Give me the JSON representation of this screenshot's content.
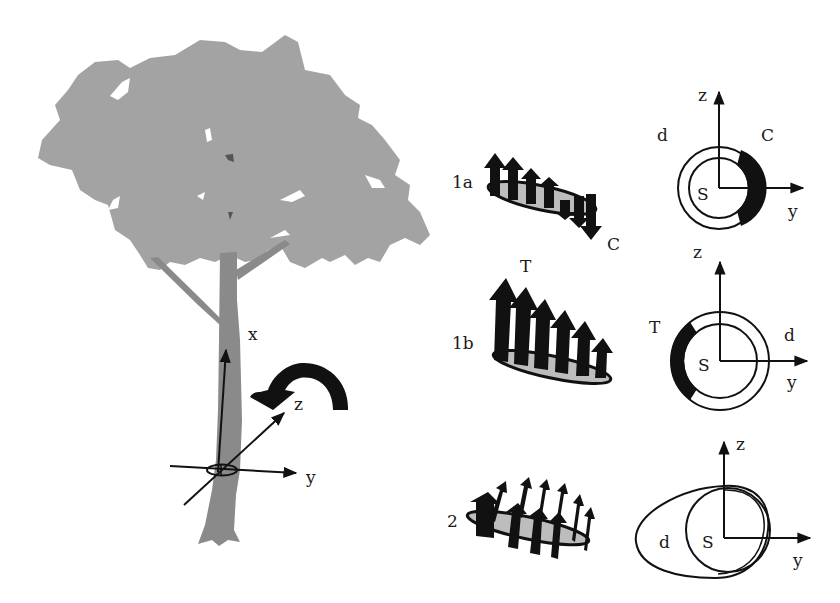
{
  "colors": {
    "crown": "#a3a3a3",
    "trunk": "#8a8a8a",
    "ink": "#111111",
    "disk_fill": "#bdbdbd",
    "background": "#ffffff"
  },
  "tree": {
    "axis_labels": {
      "x": "x",
      "y": "y",
      "z": "z"
    },
    "rotation_arrow": "curved-arrow-about-z"
  },
  "cases": [
    {
      "id": "1a",
      "label": "1a",
      "stress_label": "C",
      "cross_section": {
        "axis_z": "z",
        "axis_y": "y",
        "center": "S",
        "ring": "d",
        "stress_label": "C",
        "highlight_side": "right"
      }
    },
    {
      "id": "1b",
      "label": "1b",
      "stress_label": "T",
      "cross_section": {
        "axis_z": "z",
        "axis_y": "y",
        "center": "S",
        "ring": "d",
        "stress_label": "T",
        "highlight_side": "left"
      }
    },
    {
      "id": "2",
      "label": "2",
      "cross_section": {
        "axis_z": "z",
        "axis_y": "y",
        "center": "S",
        "ring": "d",
        "shape": "egg-shaped eccentric ring"
      }
    }
  ]
}
